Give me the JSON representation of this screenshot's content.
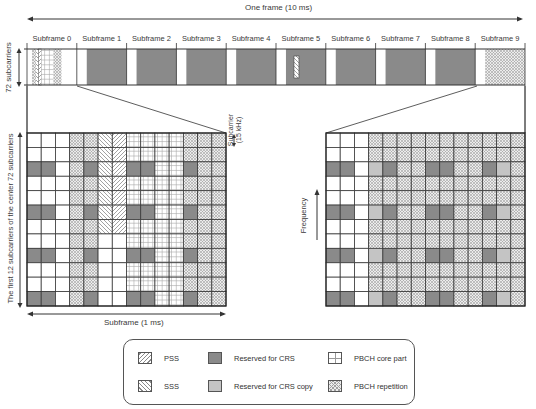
{
  "title": "One frame (10 ms)",
  "frame": {
    "subframes": [
      "Subframe 0",
      "Subframe 1",
      "Subframe 2",
      "Subframe 3",
      "Subframe 4",
      "Subframe 5",
      "Subframe 6",
      "Subframe 7",
      "Subframe 8",
      "Subframe 9"
    ],
    "height_label": "72 subcarriers"
  },
  "left_grid": {
    "y_label": "The first 12 subcarriers of the center 72 subcarriers",
    "x_label": "Subframe (1 ms)",
    "subcarrier_label_1": "Subcarrier",
    "subcarrier_label_2": "(15 kHz)",
    "rows": 12,
    "cols": 14,
    "cells": [
      "WWWRRSPCCCCRRR",
      "WWWRRSPCCCCRRR",
      "XXWRXSPXXCCXRR",
      "WWWRRSPCCCCRRR",
      "WWWRRSPCCCCRRR",
      "XXWRXSPXXCCXRR",
      "WWWRRSPCCCCRRR",
      "WWWRRWWCCCCRRR",
      "XXWRXWWXXCCXRR",
      "WWWRRWWCCCCRRR",
      "WWWRRWWCCCCRRR",
      "XXWRXWWXXCCXRR"
    ]
  },
  "right_grid": {
    "y_label": "Frequency",
    "rows": 12,
    "cols": 14,
    "cells": [
      "WWWRRRRRRRRRRR",
      "WWWRRRRRRRRRRR",
      "XXWYXRRXXRRXYR",
      "WWWRRRRRRRRRRR",
      "WWWRRRRRRRRRRR",
      "XXWYXRRXXRRXYR",
      "WWWRRRRRRRRRRR",
      "WWWRRRRRRRRRRR",
      "XXWYXRRXXRRXYR",
      "WWWRRRRRRRRRRR",
      "WWWRRRRRRRRRRR",
      "XXWYXRRXXRRXYR"
    ]
  },
  "legend": {
    "items": [
      {
        "key": "P",
        "label": "PSS"
      },
      {
        "key": "S",
        "label": "SSS"
      },
      {
        "key": "X",
        "label": "Reserved for CRS"
      },
      {
        "key": "Y",
        "label": "Reserved for CRS copy"
      },
      {
        "key": "C",
        "label": "PBCH core part"
      },
      {
        "key": "R",
        "label": "PBCH repetition"
      }
    ]
  },
  "colors": {
    "crs": "#8a8a8a",
    "crs_copy": "#c4c4c4",
    "grid_line": "#3a3a3a",
    "pattern": "#9a9a9a"
  }
}
